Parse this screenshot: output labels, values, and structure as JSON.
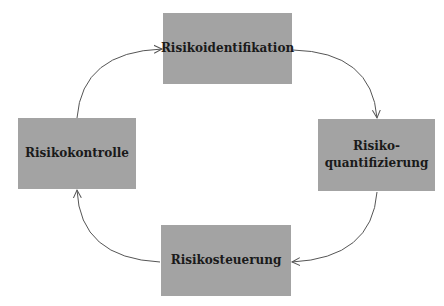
{
  "diagram": {
    "type": "cycle",
    "nodes": [
      {
        "id": "identification",
        "label": "Risikoidentifikation"
      },
      {
        "id": "quantification",
        "label": "Risiko-\nquantifizierung",
        "line1": "Risiko-",
        "line2": "quantifizierung"
      },
      {
        "id": "steering",
        "label": "Risikosteuerung"
      },
      {
        "id": "control",
        "label": "Risikokontrolle"
      }
    ],
    "edges": [
      {
        "from": "identification",
        "to": "quantification"
      },
      {
        "from": "quantification",
        "to": "steering"
      },
      {
        "from": "steering",
        "to": "control"
      },
      {
        "from": "control",
        "to": "identification"
      }
    ],
    "colors": {
      "box_fill": "#a3a3a3",
      "text": "#1a1a1a",
      "arrow": "#555555"
    }
  }
}
